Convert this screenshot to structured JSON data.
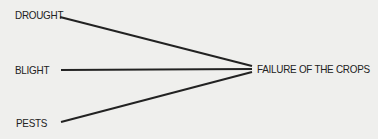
{
  "diagram": {
    "type": "cause-effect",
    "causes": [
      {
        "label": "DROUGHT"
      },
      {
        "label": "BLIGHT"
      },
      {
        "label": "PESTS"
      }
    ],
    "effect": {
      "label": "FAILURE OF THE CROPS"
    },
    "colors": {
      "background": "#efefed",
      "line": "#222222",
      "text": "#222222"
    }
  }
}
